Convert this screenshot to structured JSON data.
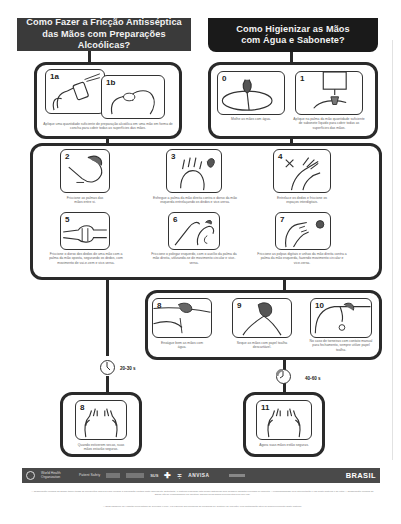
{
  "headers": {
    "alcohol": "Como Fazer a Fricção Antisséptica das Mãos com Preparações Alcoólicas?",
    "soap": "Como Higienizar as Mãos com Água e Sabonete?"
  },
  "alcohol_start": {
    "steps": [
      {
        "num": "1a"
      },
      {
        "num": "1b"
      }
    ],
    "caption": "Aplique uma quantidade suficiente de preparação alcoólica em uma mão em forma de concha para cobrir todas as superfícies das mãos."
  },
  "soap_start": {
    "steps": [
      {
        "num": "0",
        "caption": "Molhe as mãos com água."
      },
      {
        "num": "1",
        "caption": "Aplique na palma da mão quantidade suficiente de sabonete líquido para cobrir todas as superfícies das mãos."
      }
    ]
  },
  "common_steps": [
    {
      "num": "2",
      "caption": "Friccione as palmas das mãos entre si."
    },
    {
      "num": "3",
      "caption": "Esfregue a palma da mão direita contra o dorso da mão esquerda entrelaçando os dedos e vice-versa."
    },
    {
      "num": "4",
      "caption": "Entrelace os dedos e friccione os espaços interdigitais."
    },
    {
      "num": "5",
      "caption": "Friccione o dorso dos dedos de uma mão com a palma da mão oposta, segurando os dedos, com movimento de vai-e-vem e vice-versa."
    },
    {
      "num": "6",
      "caption": "Friccione o polegar esquerdo, com o auxílio da palma da mão direita, utilizando-se de movimento circular e vice-versa."
    },
    {
      "num": "7",
      "caption": "Friccione as polpas digitais e unhas da mão direita contra a palma da mão esquerda, fazendo movimento circular e vice-versa."
    }
  ],
  "soap_finish": [
    {
      "num": "8",
      "caption": "Enxágue bem as mãos com água."
    },
    {
      "num": "9",
      "caption": "Seque as mãos com papel toalha descartável."
    },
    {
      "num": "10",
      "caption": "No caso de torneiras com contato manual para fechamento, sempre utilize papel toalha."
    }
  ],
  "alcohol_end": {
    "num": "8",
    "caption": "Quando estiverem secas, suas mãos estarão seguras.",
    "timer": "20-30 s"
  },
  "soap_end": {
    "num": "11",
    "caption": "Agora suas mãos estão seguras.",
    "timer": "40-60 s"
  },
  "logos": {
    "who": "World Health Organization",
    "patient_safety": "Patient Safety",
    "sus": "SUS",
    "anvisa": "ANVISA",
    "brasil": "BRASIL"
  },
  "footer": {
    "disclaimer": "A Organização Mundial da Saúde tomou todas as precauções cabíveis para verificar a informação contida neste documento. Entretanto, o material publicado está sendo distribuído sem qualquer garantia expressa ou implícita. A responsabilidade pela interpretação e uso deste material é do leitor. A Organização Mundial da Saúde não se responsabiliza em hipótese alguma pelos danos provenientes pelo seu uso.",
    "acknowledgement": "A OMS agradece ao Hospital Universitário de Genebra (HUG), em especial aos membros do Programa de Controle de Infecção, pela participação ativa no desenvolvimento deste material."
  }
}
